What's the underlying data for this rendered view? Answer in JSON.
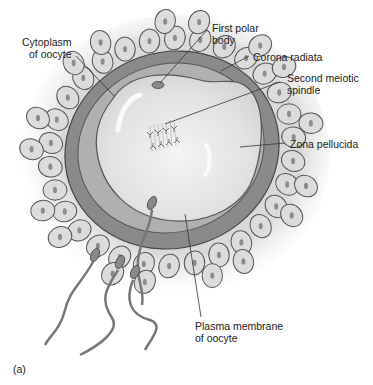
{
  "figure": {
    "panel_label": "(a)",
    "labels": [
      {
        "id": "cytoplasm",
        "text": "Cytoplasm\nof oocyte"
      },
      {
        "id": "first-polar-body",
        "text": "First polar\nbody"
      },
      {
        "id": "corona-radiata",
        "text": "Corona radiata"
      },
      {
        "id": "second-meiotic-spindle",
        "text": "Second meiotic\nspindle"
      },
      {
        "id": "zona-pellucida",
        "text": "Zona pellucida"
      },
      {
        "id": "plasma-membrane",
        "text": "Plasma membrane\nof oocyte"
      }
    ],
    "sperm_count": 4
  },
  "colors": {
    "background": "#ffffff",
    "zona": "#8a8a8a",
    "zona_inner_band": "#b4b4b4",
    "cytoplasm": "#e6e6e6",
    "cell_fill": "#dcdcdc",
    "cell_stroke": "#555555",
    "nucleus": "#8c8c8c",
    "leader_line": "#333333",
    "text": "#222222"
  }
}
